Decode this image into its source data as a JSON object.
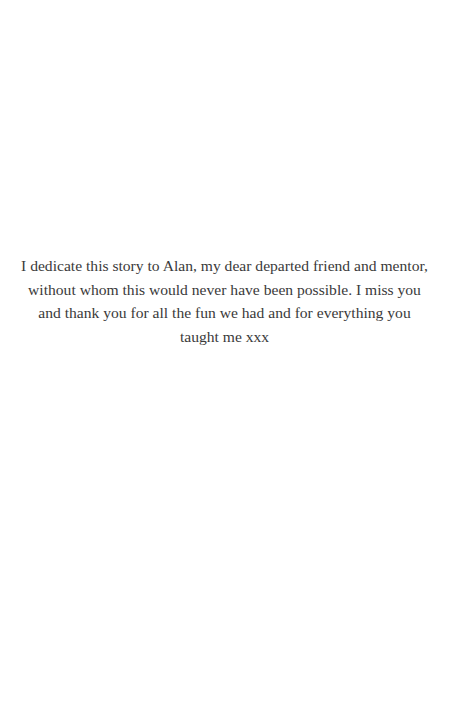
{
  "page": {
    "dedication": {
      "lines": [
        "I dedicate this story to Alan, my dear departed friend and mentor,",
        "without whom this would never have been possible. I miss you",
        "and thank you for all the fun we had and for everything you",
        "taught me xxx"
      ]
    }
  }
}
